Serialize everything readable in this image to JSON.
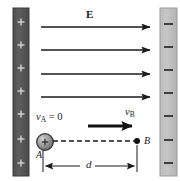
{
  "figure": {
    "background_color": "#ffffff",
    "width": 180,
    "height": 181
  },
  "plates": {
    "left": {
      "name": "positive-plate",
      "charge_symbol": "+",
      "charge_count": 7,
      "fill_color": "#5a5a5a",
      "edge_color": "#3a3a3a",
      "symbol_color": "#d8d8d8",
      "x": 13,
      "y": 8,
      "w": 16,
      "h": 168
    },
    "right": {
      "name": "negative-plate",
      "charge_symbol": "−",
      "charge_count": 7,
      "fill_color": "#b9b9b9",
      "edge_color": "#8f8f8f",
      "symbol_color": "#333333",
      "x": 160,
      "y": 8,
      "w": 17,
      "h": 168
    }
  },
  "field": {
    "label": "E",
    "label_x": 86,
    "label_y": 10,
    "arrow_color": "#1a1a1a",
    "arrow_x_start": 41,
    "arrow_x_end": 152,
    "arrow_ys": [
      27,
      50,
      74,
      97
    ]
  },
  "particle": {
    "name": "charged-sphere",
    "charge_symbol": "+",
    "cx": 45,
    "cy": 142,
    "r": 8,
    "fill_color": "#9a9a9a",
    "highlight_color": "#cfcfcf",
    "edge_color": "#2e2e2e"
  },
  "points": {
    "a": {
      "label": "A",
      "x": 36,
      "y": 150
    },
    "b": {
      "label": "B",
      "x": 144,
      "y": 136,
      "dot_x": 137,
      "dot_y": 141,
      "dot_r": 3
    }
  },
  "velocities": {
    "initial": {
      "label_v": "v",
      "label_sub": "A",
      "label_eq": " = 0",
      "x": 36,
      "y": 112
    },
    "final": {
      "label_v": "v",
      "label_sub": "B",
      "x": 125,
      "y": 107
    },
    "arrow": {
      "x_start": 88,
      "x_end": 134,
      "y": 126,
      "color": "#111111",
      "thickness": 3
    }
  },
  "path": {
    "name": "trajectory-dashed-line",
    "x_start": 53,
    "x_end": 135,
    "y": 141,
    "dash": "5,3",
    "color": "#1a1a1a"
  },
  "dimension": {
    "label": "d",
    "label_x": 86,
    "label_y": 159,
    "line_y": 166,
    "x_start": 43,
    "x_end": 137,
    "tick_top": 150,
    "tick_bottom": 172,
    "color": "#1a1a1a"
  }
}
